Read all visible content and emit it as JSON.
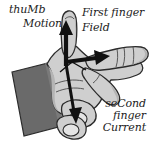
{
  "diagram": {
    "background_color": "#ffffff",
    "ink_color": "#1b1b1b",
    "skin_color": "#cfcfcf",
    "skin_shadow_color": "#a9a9a9",
    "sleeve_color": "#6a6a6a",
    "outline_color": "#2b2b2b",
    "arrow_color": "#111111"
  },
  "labels": {
    "thumb_part": "thuMb",
    "thumb_quantity": "Motion",
    "first_finger_part": "First finger",
    "first_finger_quantity": "Field",
    "second_finger_part": "seCond",
    "second_finger_part_2": "finger",
    "second_finger_quantity": "Current"
  },
  "arrows": [
    {
      "name": "motion-arrow",
      "direction": "up",
      "quantity": "Motion",
      "maps_to": "thuMb"
    },
    {
      "name": "field-arrow",
      "direction": "right",
      "quantity": "Field",
      "maps_to": "First finger"
    },
    {
      "name": "current-arrow",
      "direction": "down-toward",
      "quantity": "Current",
      "maps_to": "seCond finger"
    }
  ]
}
